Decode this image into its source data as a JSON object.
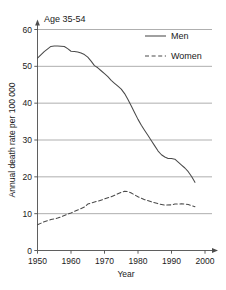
{
  "chart_data": {
    "type": "line",
    "title": "Age 35-54",
    "xlabel": "Year",
    "ylabel": "Annual death rate per 100 000",
    "xlim": [
      1950,
      2000
    ],
    "ylim": [
      0,
      60
    ],
    "xticks": [
      1950,
      1960,
      1970,
      1980,
      1990,
      2000
    ],
    "yticks": [
      0,
      10,
      20,
      30,
      40,
      50,
      60
    ],
    "xtick_labels": [
      "1950",
      "1960",
      "1970",
      "1980",
      "1990",
      "2000"
    ],
    "ytick_labels": [
      "0",
      "10",
      "20",
      "30",
      "40",
      "50",
      "60"
    ],
    "grid": "horizontal",
    "legend_position": "top-right",
    "series": [
      {
        "name": "Men",
        "style": "solid",
        "color": "#4a4a4a",
        "x": [
          1950,
          1952,
          1954,
          1955,
          1956,
          1958,
          1959,
          1960,
          1961,
          1962,
          1963,
          1964,
          1965,
          1966,
          1967,
          1968,
          1969,
          1970,
          1971,
          1972,
          1973,
          1974,
          1975,
          1976,
          1977,
          1978,
          1979,
          1980,
          1981,
          1982,
          1983,
          1984,
          1985,
          1986,
          1987,
          1988,
          1989,
          1990,
          1991,
          1992,
          1993,
          1994,
          1995,
          1996,
          1997
        ],
        "y": [
          52.2,
          54.0,
          55.4,
          55.5,
          55.5,
          55.4,
          54.8,
          54.1,
          54.0,
          53.9,
          53.6,
          53.2,
          52.5,
          51.4,
          50.2,
          49.6,
          48.8,
          48.0,
          47.2,
          46.2,
          45.4,
          44.6,
          43.8,
          42.6,
          41.0,
          39.2,
          37.4,
          35.6,
          34.0,
          32.6,
          31.2,
          29.8,
          28.4,
          27.0,
          26.0,
          25.4,
          25.0,
          25.0,
          24.8,
          24.0,
          23.2,
          22.4,
          21.4,
          20.1,
          18.5
        ]
      },
      {
        "name": "Women",
        "style": "dashed",
        "color": "#4a4a4a",
        "x": [
          1950,
          1952,
          1954,
          1956,
          1958,
          1960,
          1962,
          1964,
          1965,
          1966,
          1968,
          1970,
          1972,
          1974,
          1975,
          1976,
          1977,
          1978,
          1980,
          1982,
          1984,
          1986,
          1988,
          1990,
          1991,
          1992,
          1993,
          1994,
          1995,
          1996,
          1997
        ],
        "y": [
          7.0,
          7.8,
          8.4,
          8.8,
          9.5,
          10.2,
          11.0,
          11.8,
          12.6,
          12.9,
          13.4,
          14.0,
          14.6,
          15.4,
          15.8,
          16.1,
          16.0,
          15.6,
          14.6,
          13.8,
          13.2,
          12.7,
          12.3,
          12.4,
          12.6,
          12.6,
          12.7,
          12.6,
          12.5,
          12.2,
          11.9
        ]
      }
    ]
  },
  "legend": {
    "items": [
      {
        "label": "Men",
        "style": "solid"
      },
      {
        "label": "Women",
        "style": "dashed"
      }
    ]
  }
}
